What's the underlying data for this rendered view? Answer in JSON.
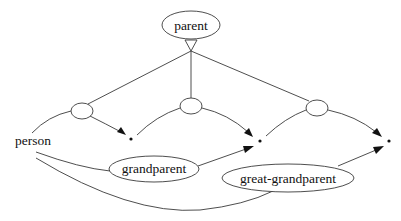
{
  "diagram": {
    "type": "relationship-graph",
    "nodes": {
      "parent": {
        "label": "parent",
        "cx": 191,
        "cy": 25,
        "rx": 29,
        "ry": 14
      },
      "person": {
        "label": "person",
        "x": 33,
        "y": 145
      },
      "grandparent": {
        "label": "grandparent",
        "cx": 154,
        "cy": 169,
        "rx": 45,
        "ry": 13
      },
      "great_grandparent": {
        "label": "great-grandparent",
        "cx": 288,
        "cy": 178,
        "rx": 66,
        "ry": 14
      }
    },
    "join_nodes": [
      {
        "cx": 82,
        "cy": 111
      },
      {
        "cx": 191,
        "cy": 106
      },
      {
        "cx": 317,
        "cy": 108
      }
    ],
    "endpoints": [
      {
        "x": 131,
        "y": 139
      },
      {
        "x": 260,
        "y": 141
      },
      {
        "x": 389,
        "y": 141
      }
    ],
    "colors": {
      "stroke": "#3a3a3a",
      "text": "#111111",
      "background": "#ffffff"
    }
  }
}
